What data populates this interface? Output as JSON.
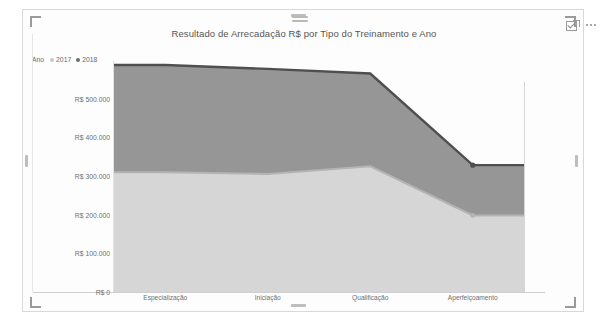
{
  "visual": {
    "title": "Resultado de Arrecadação R$ por Tipo do Treinamento e Ano",
    "focus_icon": "focus-mode-icon",
    "more_icon": "more-options-icon",
    "drag_handle": "resize-grip"
  },
  "legend": {
    "title": "Ano",
    "items": [
      {
        "label": "2017",
        "color": "#d6d6d6"
      },
      {
        "label": "2018",
        "color": "#8f8f8f"
      }
    ]
  },
  "axes": {
    "y_ticks": [
      "R$ 500.000",
      "R$ 400.000",
      "R$ 300.000",
      "R$ 200.000",
      "R$ 100.000",
      "R$ 0"
    ],
    "x_ticks": [
      "Especialização",
      "Iniciação",
      "Qualificação",
      "Aperfeiçoamento"
    ]
  },
  "chart_data": {
    "type": "area",
    "stacked": true,
    "title": "Resultado de Arrecadação R$ por Tipo do Treinamento e Ano",
    "xlabel": "",
    "ylabel": "",
    "categories": [
      "Especialização",
      "Iniciação",
      "Qualificação",
      "Aperfeiçoamento"
    ],
    "series": [
      {
        "name": "2017",
        "color": "#d6d6d6",
        "line_color": "#b4b4b4",
        "values": [
          310000,
          305000,
          325000,
          198000
        ]
      },
      {
        "name": "2018",
        "color": "#969696",
        "line_color": "#4f4f4f",
        "values": [
          277000,
          272000,
          240000,
          130000
        ]
      }
    ],
    "stacked_totals": [
      587000,
      577000,
      565000,
      328000
    ],
    "ylim": [
      0,
      600000
    ],
    "y_tick_values": [
      0,
      100000,
      200000,
      300000,
      400000,
      500000
    ],
    "grid": false,
    "legend_position": "top-left",
    "currency_prefix": "R$"
  }
}
